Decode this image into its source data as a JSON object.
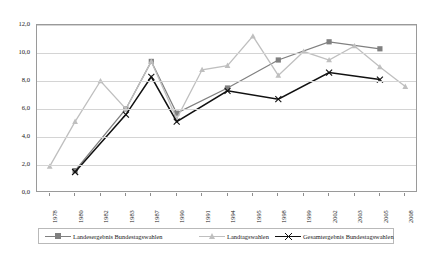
{
  "chart_data": {
    "type": "line",
    "title": "",
    "xlabel": "",
    "ylabel": "",
    "ylim": [
      0.0,
      12.0
    ],
    "yticks": [
      "0,0",
      "2,0",
      "4,0",
      "6,0",
      "8,0",
      "10,0",
      "12,0"
    ],
    "ytick_values": [
      0,
      2,
      4,
      6,
      8,
      10,
      12
    ],
    "grid": true,
    "legend_position": "bottom",
    "categories": [
      "1978",
      "1980",
      "1982",
      "1983",
      "1987",
      "1990",
      "1991",
      "1994",
      "1995",
      "1998",
      "1999",
      "2002",
      "2003",
      "2005",
      "2008"
    ],
    "series": [
      {
        "name": "Landesergebnis Bundestagswahlen",
        "color": "#808080",
        "marker": "square",
        "values": [
          null,
          1.6,
          null,
          6.0,
          9.4,
          5.7,
          null,
          7.5,
          null,
          9.5,
          null,
          10.8,
          null,
          10.3,
          null
        ]
      },
      {
        "name": "Landtagswahlen",
        "color": "#bfbfbf",
        "marker": "triangle",
        "values": [
          1.9,
          5.1,
          8.0,
          6.0,
          9.4,
          5.3,
          8.8,
          9.1,
          11.2,
          8.4,
          10.1,
          9.5,
          10.5,
          9.0,
          7.6
        ]
      },
      {
        "name": "Gesamtergebnis Bundestagswahlen",
        "color": "#111111",
        "marker": "x",
        "values": [
          null,
          1.5,
          null,
          5.6,
          8.3,
          5.1,
          null,
          7.3,
          null,
          6.7,
          null,
          8.6,
          null,
          8.1,
          null
        ]
      }
    ]
  },
  "legend": {
    "items": [
      {
        "label": "Landesergebnis Bundestagswahlen"
      },
      {
        "label": "Landtagswahlen"
      },
      {
        "label": "Gesamtergebnis Bundestagswahlen"
      }
    ]
  }
}
